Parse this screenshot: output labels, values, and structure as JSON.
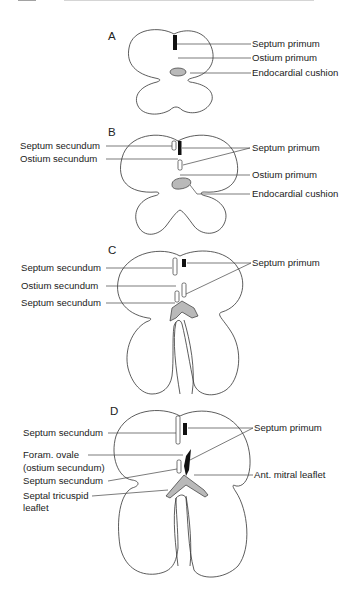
{
  "figure": {
    "header": {
      "cropped": true
    },
    "panels": [
      {
        "id": "A",
        "label": "A",
        "labels": {
          "septum_primum": "Septum primum",
          "ostium_primum": "Ostium primum",
          "endocardial_cushion": "Endocardial cushion"
        }
      },
      {
        "id": "B",
        "label": "B",
        "labels": {
          "septum_secundum": "Septum secundum",
          "ostium_secundum": "Ostium secundum",
          "septum_primum": "Septum primum",
          "ostium_primum": "Ostium primum",
          "endocardial_cushion": "Endocardial cushion"
        }
      },
      {
        "id": "C",
        "label": "C",
        "labels": {
          "septum_secundum_top": "Septum secundum",
          "ostium_secundum": "Ostium secundum",
          "septum_secundum_bottom": "Septum secundum",
          "septum_primum": "Septum primum"
        }
      },
      {
        "id": "D",
        "label": "D",
        "labels": {
          "septum_secundum_top": "Septum secundum",
          "foramen_ovale_line1": "Foram. ovale",
          "foramen_ovale_line2": "(ostium secundum)",
          "septum_secundum_bottom": "Septum secundum",
          "septal_tricuspid_line1": "Septal tricuspid",
          "septal_tricuspid_line2": "leaflet",
          "septum_primum": "Septum primum",
          "ant_mitral_leaflet": "Ant. mitral leaflet"
        }
      }
    ],
    "colors": {
      "outline": "#333333",
      "septum_primum_fill": "#111111",
      "cushion_fill": "#b9b9b9",
      "background": "#ffffff"
    }
  }
}
